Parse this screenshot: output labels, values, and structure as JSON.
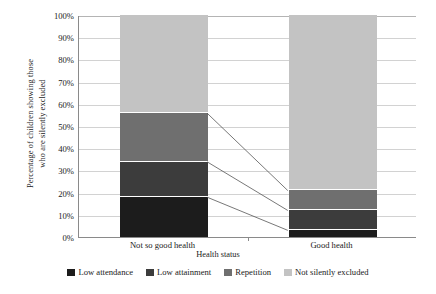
{
  "chart_data": {
    "type": "bar",
    "stacked": true,
    "stack_mode": "percent",
    "title": "",
    "xlabel": "Health status",
    "ylabel": "Percentage of children showing those\nwho are silently excluded",
    "categories": [
      "Not so good health",
      "Good health"
    ],
    "ylim": [
      0,
      100
    ],
    "ytick_labels": [
      "0%",
      "10%",
      "20%",
      "30%",
      "40%",
      "50%",
      "60%",
      "70%",
      "80%",
      "90%",
      "100%"
    ],
    "ytick_values": [
      0,
      10,
      20,
      30,
      40,
      50,
      60,
      70,
      80,
      90,
      100
    ],
    "grid": true,
    "legend_position": "bottom",
    "series": [
      {
        "name": "Low attendance",
        "color": "#1c1c1c",
        "values": [
          18,
          3
        ]
      },
      {
        "name": "Low attainment",
        "color": "#3c3c3c",
        "values": [
          16,
          9
        ]
      },
      {
        "name": "Repetition",
        "color": "#6f6f6f",
        "values": [
          22,
          9
        ]
      },
      {
        "name": "Not silently excluded",
        "color": "#c3c3c3",
        "values": [
          44,
          79
        ]
      }
    ],
    "connectors": [
      {
        "from_category": 0,
        "from_value": 56,
        "to_category": 1,
        "to_value": 21
      },
      {
        "from_category": 0,
        "from_value": 34,
        "to_category": 1,
        "to_value": 12
      },
      {
        "from_category": 0,
        "from_value": 18,
        "to_category": 1,
        "to_value": 3
      }
    ]
  },
  "axis_colors": {
    "axis_line": "#8a8a8a",
    "gridline": "#d2d2d2",
    "connector": "#555555"
  }
}
